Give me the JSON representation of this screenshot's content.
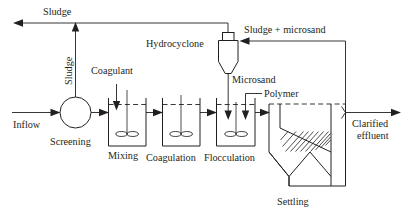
{
  "diagram": {
    "type": "process-flow",
    "stroke_color": "#231f20",
    "background_color": "#ffffff",
    "labels": {
      "sludge_top": "Sludge",
      "sludge_vertical": "Sludge",
      "coagulant": "Coagulant",
      "hydrocyclone": "Hydrocyclone",
      "sludge_microsand": "Sludge + microsand",
      "microsand": "Microsand",
      "polymer": "Polymer",
      "inflow": "Inflow",
      "screening": "Screening",
      "mixing": "Mixing",
      "coagulation": "Coagulation",
      "flocculation": "Flocculation",
      "settling": "Settling",
      "clarified_effluent_line1": "Clarified",
      "clarified_effluent_line2": "effluent"
    },
    "units": [
      {
        "name": "screening",
        "label": "Screening",
        "shape": "circle"
      },
      {
        "name": "mixing",
        "label": "Mixing",
        "shape": "stirred-tank"
      },
      {
        "name": "coagulation",
        "label": "Coagulation",
        "shape": "stirred-tank"
      },
      {
        "name": "flocculation",
        "label": "Flocculation",
        "shape": "stirred-tank"
      },
      {
        "name": "settling",
        "label": "Settling",
        "shape": "lamella-clarifier"
      },
      {
        "name": "hydrocyclone",
        "label": "Hydrocyclone",
        "shape": "cyclone"
      }
    ],
    "streams": [
      {
        "name": "inflow",
        "label": "Inflow",
        "direction": "right"
      },
      {
        "name": "sludge-to-waste",
        "label": "Sludge",
        "direction": "left"
      },
      {
        "name": "sludge-from-screening",
        "label": "Sludge",
        "direction": "up"
      },
      {
        "name": "coagulant-dose",
        "label": "Coagulant",
        "direction": "down"
      },
      {
        "name": "microsand-dose",
        "label": "Microsand",
        "direction": "down"
      },
      {
        "name": "polymer-dose",
        "label": "Polymer",
        "direction": "down"
      },
      {
        "name": "sludge-microsand-recycle",
        "label": "Sludge + microsand",
        "direction": "left"
      },
      {
        "name": "clarified-effluent",
        "label": "Clarified effluent",
        "direction": "right"
      }
    ]
  }
}
